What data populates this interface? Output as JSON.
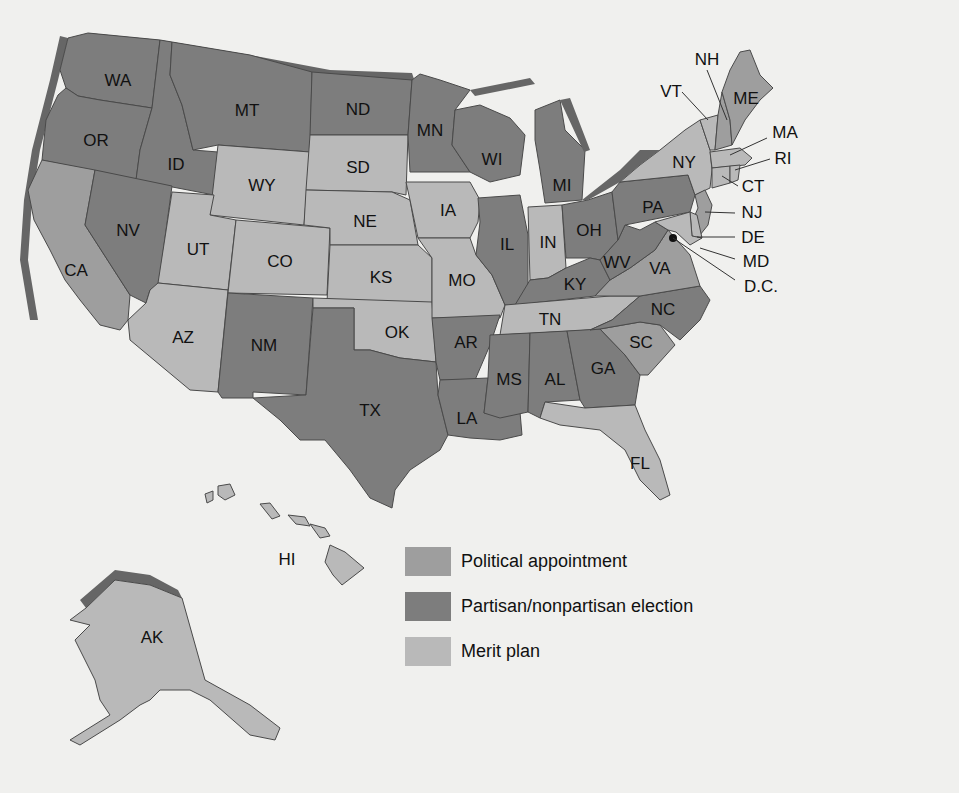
{
  "map": {
    "type": "choropleth",
    "subject": "Methods of selecting state judges",
    "colors": {
      "political_appointment": "#9e9e9e",
      "election": "#7d7d7d",
      "merit_plan": "#b9b9b9",
      "background": "#f0f0ee",
      "shadow": "#666666"
    }
  },
  "legend": {
    "items": [
      {
        "key": "political_appointment",
        "label": "Political appointment",
        "color": "#9e9e9e"
      },
      {
        "key": "election",
        "label": "Partisan/nonpartisan election",
        "color": "#7d7d7d"
      },
      {
        "key": "merit_plan",
        "label": "Merit plan",
        "color": "#b9b9b9"
      }
    ]
  },
  "states": {
    "WA": {
      "label": "WA",
      "category": "election"
    },
    "OR": {
      "label": "OR",
      "category": "election"
    },
    "CA": {
      "label": "CA",
      "category": "political_appointment"
    },
    "ID": {
      "label": "ID",
      "category": "election"
    },
    "NV": {
      "label": "NV",
      "category": "election"
    },
    "MT": {
      "label": "MT",
      "category": "election"
    },
    "WY": {
      "label": "WY",
      "category": "merit_plan"
    },
    "UT": {
      "label": "UT",
      "category": "merit_plan"
    },
    "AZ": {
      "label": "AZ",
      "category": "merit_plan"
    },
    "CO": {
      "label": "CO",
      "category": "merit_plan"
    },
    "NM": {
      "label": "NM",
      "category": "election"
    },
    "ND": {
      "label": "ND",
      "category": "election"
    },
    "SD": {
      "label": "SD",
      "category": "merit_plan"
    },
    "NE": {
      "label": "NE",
      "category": "merit_plan"
    },
    "KS": {
      "label": "KS",
      "category": "merit_plan"
    },
    "OK": {
      "label": "OK",
      "category": "merit_plan"
    },
    "TX": {
      "label": "TX",
      "category": "election"
    },
    "MN": {
      "label": "MN",
      "category": "election"
    },
    "IA": {
      "label": "IA",
      "category": "merit_plan"
    },
    "MO": {
      "label": "MO",
      "category": "merit_plan"
    },
    "AR": {
      "label": "AR",
      "category": "election"
    },
    "LA": {
      "label": "LA",
      "category": "election"
    },
    "WI": {
      "label": "WI",
      "category": "election"
    },
    "IL": {
      "label": "IL",
      "category": "election"
    },
    "MI": {
      "label": "MI",
      "category": "election"
    },
    "IN": {
      "label": "IN",
      "category": "merit_plan"
    },
    "OH": {
      "label": "OH",
      "category": "election"
    },
    "KY": {
      "label": "KY",
      "category": "election"
    },
    "TN": {
      "label": "TN",
      "category": "merit_plan"
    },
    "MS": {
      "label": "MS",
      "category": "election"
    },
    "AL": {
      "label": "AL",
      "category": "election"
    },
    "GA": {
      "label": "GA",
      "category": "election"
    },
    "FL": {
      "label": "FL",
      "category": "merit_plan"
    },
    "SC": {
      "label": "SC",
      "category": "political_appointment"
    },
    "NC": {
      "label": "NC",
      "category": "election"
    },
    "VA": {
      "label": "VA",
      "category": "political_appointment"
    },
    "WV": {
      "label": "WV",
      "category": "election"
    },
    "PA": {
      "label": "PA",
      "category": "election"
    },
    "NY": {
      "label": "NY",
      "category": "merit_plan"
    },
    "VT": {
      "label": "VT",
      "category": "merit_plan"
    },
    "NH": {
      "label": "NH",
      "category": "political_appointment"
    },
    "ME": {
      "label": "ME",
      "category": "political_appointment"
    },
    "MA": {
      "label": "MA",
      "category": "merit_plan"
    },
    "RI": {
      "label": "RI",
      "category": "merit_plan"
    },
    "CT": {
      "label": "CT",
      "category": "merit_plan"
    },
    "NJ": {
      "label": "NJ",
      "category": "political_appointment"
    },
    "DE": {
      "label": "DE",
      "category": "merit_plan"
    },
    "MD": {
      "label": "MD",
      "category": "merit_plan"
    },
    "DC": {
      "label": "D.C.",
      "category": "merit_plan"
    },
    "AK": {
      "label": "AK",
      "category": "merit_plan"
    },
    "HI": {
      "label": "HI",
      "category": "merit_plan"
    }
  }
}
